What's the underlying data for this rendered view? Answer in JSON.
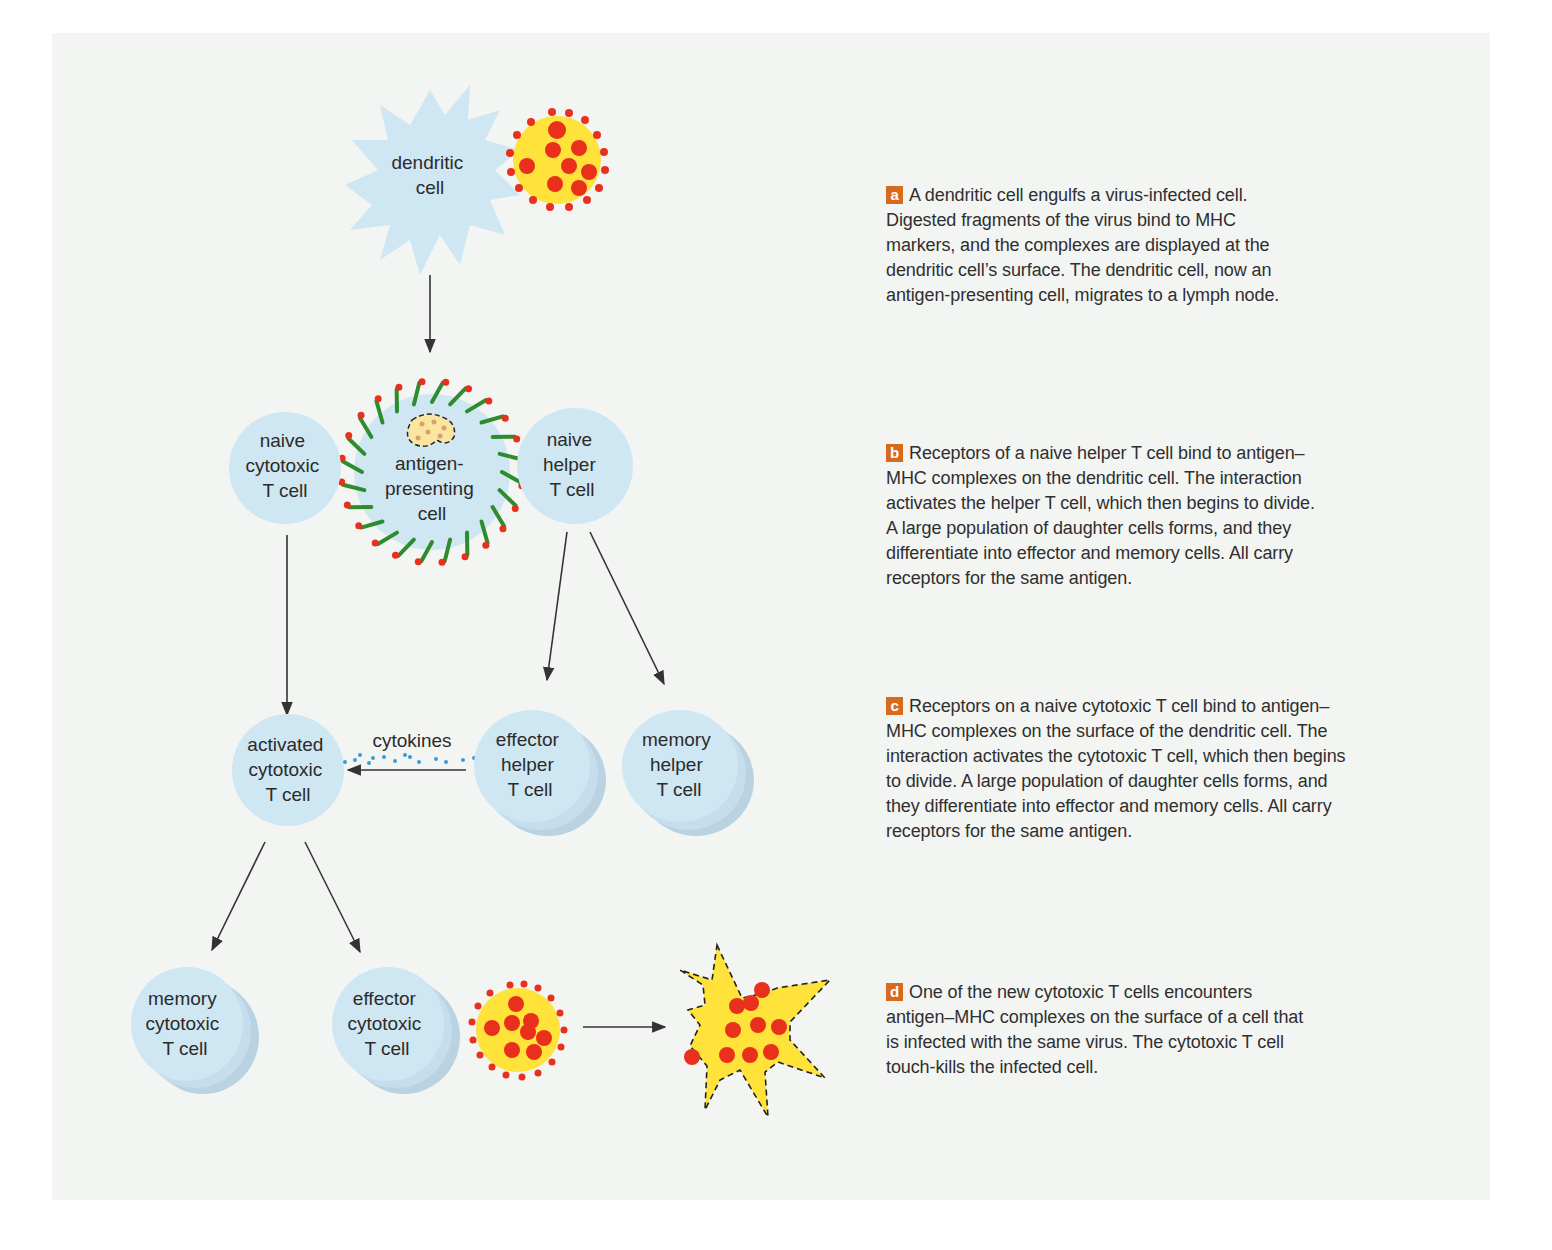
{
  "colors": {
    "panel_bg": "#f3f5f3",
    "t_cell": "#cfe6f3",
    "infected_cell": "#ffe23a",
    "virus_particle": "#e8301c",
    "mhc_marker": "#2e8b2e",
    "badge": "#d86a1e",
    "cytokine_dots": "#3b9bd6",
    "arrow": "#333333"
  },
  "cells": {
    "dendritic": [
      "dendritic",
      "cell"
    ],
    "apc": [
      "antigen-",
      "presenting",
      "cell"
    ],
    "naive_cytotoxic": [
      "naive",
      "cytotoxic",
      "T cell"
    ],
    "naive_helper": [
      "naive",
      "helper",
      "T cell"
    ],
    "activated_cytotoxic": [
      "activated",
      "cytotoxic",
      "T cell"
    ],
    "effector_helper": [
      "effector",
      "helper",
      "T cell"
    ],
    "memory_helper": [
      "memory",
      "helper",
      "T cell"
    ],
    "memory_cytotoxic": [
      "memory",
      "cytotoxic",
      "T cell"
    ],
    "effector_cytotoxic": [
      "effector",
      "cytotoxic",
      "T cell"
    ]
  },
  "cytokines_label": "cytokines",
  "steps": [
    {
      "letter": "a",
      "lines": [
        "A dendritic cell engulfs a virus-infected cell.",
        "Digested fragments of the virus bind to MHC",
        "markers, and the complexes are displayed at the",
        "dendritic cell’s surface. The dendritic cell, now an",
        "antigen-presenting cell, migrates to a lymph node."
      ]
    },
    {
      "letter": "b",
      "lines": [
        "Receptors of a naive helper T cell bind to antigen–",
        "MHC complexes on the dendritic cell. The interaction",
        "activates the helper T cell, which then begins to divide.",
        "A large population of daughter cells forms, and they",
        "differentiate into effector and memory cells. All carry",
        "receptors for the same antigen."
      ]
    },
    {
      "letter": "c",
      "lines": [
        "Receptors on a naive cytotoxic T cell bind to antigen–",
        "MHC complexes on the surface of the dendritic cell. The",
        "interaction activates the cytotoxic T cell, which then begins",
        "to divide. A large population of daughter cells forms, and",
        "they differentiate into effector and memory cells. All carry",
        "receptors for the same antigen."
      ]
    },
    {
      "letter": "d",
      "lines": [
        "One of the new cytotoxic T cells encounters",
        "antigen–MHC complexes on the surface of a cell that",
        "is infected with the same virus. The cytotoxic T cell",
        "touch-kills the infected cell."
      ]
    }
  ]
}
